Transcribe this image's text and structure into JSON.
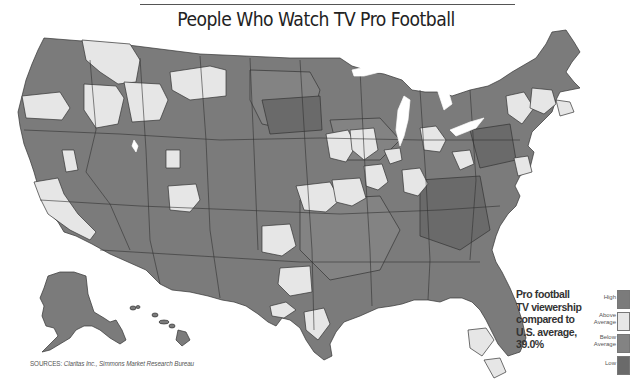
{
  "title": "People Who Watch TV Pro Football",
  "annotation": {
    "lines": [
      "Pro football",
      "TV viewership",
      "compared to",
      "U.S. average,",
      "39.0%"
    ],
    "us_average": "39.0%"
  },
  "legend": {
    "items": [
      {
        "label_lines": [
          "High"
        ],
        "category": "high",
        "color": "#7b7b7b"
      },
      {
        "label_lines": [
          "Above",
          "Average"
        ],
        "category": "above-average",
        "color": "#e6e6e6"
      },
      {
        "label_lines": [
          "Below",
          "Average"
        ],
        "category": "below-average",
        "color": "#838383"
      },
      {
        "label_lines": [
          "Low"
        ],
        "category": "low",
        "color": "#6a6a6a"
      }
    ]
  },
  "sources": {
    "prefix": "SOURCES:",
    "text": "Claritas Inc., Simmons Market Research Bureau"
  },
  "colors": {
    "high": "#7b7b7b",
    "above_average": "#e6e6e6",
    "below_average": "#838383",
    "low": "#6a6a6a",
    "water": "#ffffff",
    "border": "#333333"
  },
  "map": {
    "type": "choropleth",
    "geography": "United States media markets",
    "metric": "Pro football TV viewership compared to U.S. average",
    "categories": [
      "High",
      "Above Average",
      "Below Average",
      "Low"
    ],
    "insets": [
      "Alaska",
      "Hawaii"
    ]
  }
}
